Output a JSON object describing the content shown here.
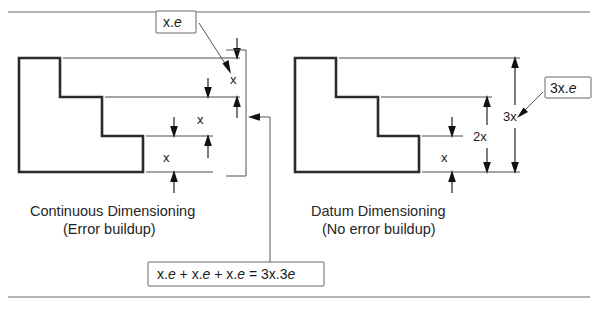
{
  "figure": {
    "title_rules": {
      "top": "horizontal-rule",
      "bottom": "horizontal-rule"
    },
    "left_panel": {
      "caption_line1": "Continuous Dimensioning",
      "caption_line2": "(Error buildup)",
      "callout_label": "x.e",
      "dimensions": [
        {
          "label": "x",
          "order": 1
        },
        {
          "label": "x",
          "order": 2
        },
        {
          "label": "x",
          "order": 3
        }
      ]
    },
    "right_panel": {
      "caption_line1": "Datum Dimensioning",
      "caption_line2": "(No error buildup)",
      "callout_label": "3x.e",
      "dimensions": [
        {
          "label": "x",
          "order": 1
        },
        {
          "label": "2x",
          "order": 2
        },
        {
          "label": "3x",
          "order": 3
        }
      ]
    },
    "formula": {
      "text": "x.e + x.e + x.e = 3x.3e"
    }
  }
}
